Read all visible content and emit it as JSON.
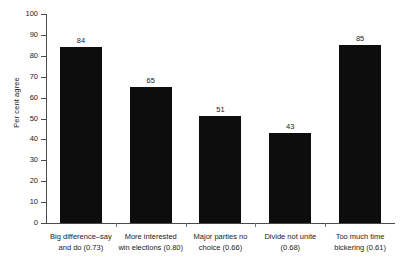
{
  "chart_data": {
    "type": "bar",
    "title": "",
    "subtitle": "",
    "xlabel": "",
    "ylabel": "Per cent agree",
    "ylim": [
      0,
      100
    ],
    "ytick_step": 10,
    "yticks": [
      100,
      90,
      80,
      70,
      60,
      50,
      40,
      30,
      20,
      10,
      0
    ],
    "grid": false,
    "legend": false,
    "bar_color": "#0d0d0d",
    "categories": [
      "Big difference–say and do (0.73)",
      "More interested win elections (0.80)",
      "Major parties no choice (0.66)",
      "Divide not unite (0.68)",
      "Too much time bickering (0.61)"
    ],
    "category_lines": [
      [
        "Big difference–say",
        "and do (0.73)"
      ],
      [
        "More interested",
        "win elections (0.80)"
      ],
      [
        "Major parties no",
        "choice (0.66)"
      ],
      [
        "Divide not unite",
        "(0.68)"
      ],
      [
        "Too much time",
        "bickering (0.61)"
      ]
    ],
    "values": [
      84,
      65,
      51,
      43,
      85
    ],
    "value_labels": [
      "84",
      "65",
      "51",
      "43",
      "85"
    ],
    "loadings": [
      0.73,
      0.8,
      0.66,
      0.68,
      0.61
    ]
  }
}
